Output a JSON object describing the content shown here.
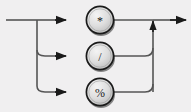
{
  "diagram": {
    "type": "railroad-syntax-diagram",
    "background_color": "#f0eff0",
    "line_color": "#4d4d4d",
    "node_fill_color": "#d9d9d9",
    "node_stroke_color": "#1a1a1a",
    "entry": {
      "name": "entry-line",
      "label": ""
    },
    "exit": {
      "name": "exit-line",
      "label": ""
    },
    "branches": [
      {
        "id": "branch-asterisk",
        "label": "*",
        "icon": "multiply-operator-node",
        "row": 1,
        "cy": 20
      },
      {
        "id": "branch-slash",
        "label": "/",
        "icon": "divide-operator-node",
        "row": 2,
        "cy": 56
      },
      {
        "id": "branch-percent",
        "label": "%",
        "icon": "modulo-operator-node",
        "row": 3,
        "cy": 92
      }
    ],
    "arrows": [
      {
        "name": "arrow-into-asterisk",
        "direction": "right"
      },
      {
        "name": "arrow-into-slash",
        "direction": "right"
      },
      {
        "name": "arrow-into-percent",
        "direction": "right"
      },
      {
        "name": "arrow-merge-up",
        "direction": "up"
      },
      {
        "name": "arrow-exit-right",
        "direction": "right"
      }
    ]
  }
}
